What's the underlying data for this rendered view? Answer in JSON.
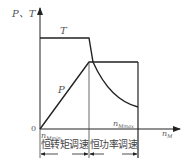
{
  "diagram": {
    "title": "",
    "y_axis_label": "P、T",
    "x_axis_label": "n_M",
    "x_axis_label_main": "n",
    "x_axis_label_sub": "M",
    "origin_label": "0",
    "curve_T_label": "T",
    "curve_P_label": "P",
    "tick_min_label_main": "n",
    "tick_min_label_sub": "Mmin",
    "tick_max_label_main": "n",
    "tick_max_label_sub": "Mmax",
    "region_left_label": "恒转矩调速",
    "region_right_label": "恒功率调速",
    "colors": {
      "line": "#222222",
      "text": "#555555"
    }
  }
}
